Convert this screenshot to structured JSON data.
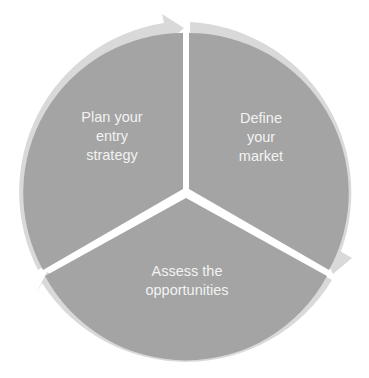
{
  "diagram": {
    "type": "cycle",
    "segments": [
      {
        "id": "define",
        "lines": [
          "Define",
          "your",
          "market"
        ]
      },
      {
        "id": "assess",
        "lines": [
          "Assess the",
          "opportunities"
        ]
      },
      {
        "id": "plan",
        "lines": [
          "Plan your",
          "entry",
          "strategy"
        ]
      }
    ],
    "colors": {
      "segment_fill": "#a4a4a4",
      "ring": "#d9d9d9",
      "text": "#f2f2f2",
      "background": "#ffffff"
    }
  }
}
